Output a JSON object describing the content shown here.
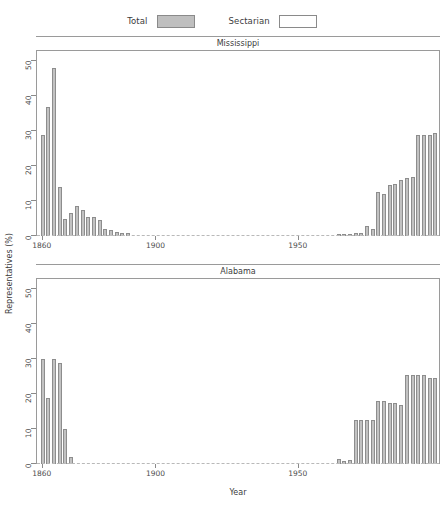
{
  "legend": {
    "entries": [
      {
        "label": "Total",
        "style": "filled",
        "color": "#bfbfbf",
        "name": "legend-swatch-total"
      },
      {
        "label": "Sectarian",
        "style": "empty",
        "color": "#ffffff",
        "name": "legend-swatch-sectarian"
      }
    ]
  },
  "axes": {
    "ylabel": "Representatives (%)",
    "xlabel": "Year",
    "yticks": [
      0,
      10,
      20,
      30,
      40,
      50
    ],
    "xticks": [
      1860,
      1900,
      1950
    ]
  },
  "chart_data": {
    "type": "bar",
    "title": "",
    "xlabel": "Year",
    "ylabel": "Representatives (%)",
    "xlim": [
      1858,
      2000
    ],
    "ylim": [
      0,
      53
    ],
    "yticks": [
      0,
      10,
      20,
      30,
      40,
      50
    ],
    "xticks": [
      1860,
      1900,
      1950
    ],
    "grid": false,
    "legend_position": "top-center",
    "legend": [
      "Total",
      "Sectarian"
    ],
    "panels": [
      {
        "name": "Mississippi",
        "x": [
          1860,
          1862,
          1864,
          1866,
          1868,
          1870,
          1872,
          1874,
          1876,
          1878,
          1880,
          1882,
          1884,
          1886,
          1888,
          1890,
          1892,
          1894,
          1896,
          1898,
          1900,
          1902,
          1904,
          1906,
          1964,
          1966,
          1968,
          1970,
          1972,
          1974,
          1976,
          1978,
          1980,
          1982,
          1984,
          1986,
          1988,
          1990,
          1992,
          1994,
          1996,
          1998
        ],
        "values": [
          29,
          37,
          48,
          14,
          5,
          6.5,
          8.5,
          7.5,
          5.5,
          5.5,
          4.5,
          2,
          1.8,
          1.2,
          1,
          0.9,
          0,
          0,
          0,
          0,
          0,
          0,
          0,
          0,
          0.5,
          0.6,
          0.7,
          0.8,
          0.9,
          3,
          2,
          12.5,
          12,
          14.5,
          15,
          16,
          16.5,
          17,
          29,
          29,
          29,
          29.5
        ]
      },
      {
        "name": "Alabama",
        "x": [
          1860,
          1862,
          1864,
          1866,
          1868,
          1870,
          1872,
          1874,
          1876,
          1878,
          1880,
          1964,
          1966,
          1968,
          1970,
          1972,
          1974,
          1976,
          1978,
          1980,
          1982,
          1984,
          1986,
          1988,
          1990,
          1992,
          1994,
          1996,
          1998
        ],
        "values": [
          30,
          19,
          30,
          29,
          10,
          2,
          0,
          0,
          0,
          0,
          0,
          1.5,
          1,
          1.2,
          12.5,
          12.5,
          12.5,
          12.5,
          18,
          18,
          17.5,
          17.5,
          17,
          25.5,
          25.5,
          25.5,
          25.5,
          24.5,
          24.5
        ]
      }
    ]
  }
}
